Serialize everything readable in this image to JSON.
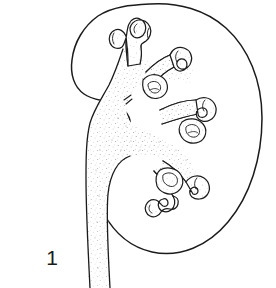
{
  "figure": {
    "label": "1",
    "label_alt": "Figure number 1",
    "background_color": "#ffffff",
    "ink_color": "#1b1b1b",
    "stipple_color": "#9a9a9a",
    "style": "black and white anatomical line drawing with stipple shading"
  },
  "structures": {
    "cortex": {
      "name": "Renal cortex outline",
      "description": "Bean-shaped outer contour of the kidney with concave hilum on the left side"
    },
    "pelvis": {
      "name": "Renal pelvis",
      "description": "Funnel-shaped central collecting cavity, stippled, narrowing inferiorly into the ureter"
    },
    "ureter": {
      "name": "Ureter",
      "description": "Tube descending from the hilum past the lower border of the kidney"
    },
    "calyces": [
      {
        "name": "Superior major calyx",
        "position": "upper"
      },
      {
        "name": "Superior minor calyx cluster",
        "position": "upper-right"
      },
      {
        "name": "Middle major calyx",
        "position": "middle-right"
      },
      {
        "name": "Middle minor calyx cluster",
        "position": "middle-right"
      },
      {
        "name": "Inferior major calyx",
        "position": "lower-right"
      },
      {
        "name": "Inferior minor calyx cluster",
        "position": "lower-right"
      }
    ]
  }
}
